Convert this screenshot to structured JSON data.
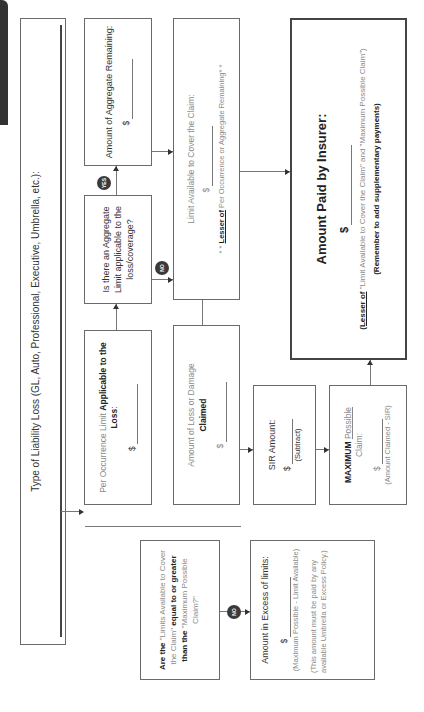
{
  "diagram": {
    "orientation": "rotated-90-ccw",
    "title_box": {
      "text": "Type of Liability Loss (GL, Auto, Professional, Executive, Umbrella, etc.):"
    },
    "per_occurrence": {
      "prefix": "Per Occurrence Limit ",
      "bold": "Applicable to the Loss",
      "suffix": ":",
      "dollar": "$"
    },
    "aggregate_question": {
      "text": "Is there an Aggregate Limit applicable to the loss/coverage?"
    },
    "aggregate_remaining": {
      "text": "Amount of Aggregate Remaining:",
      "dollar": "$"
    },
    "limit_available": {
      "text": "Limit Available to Cover the Claim:",
      "dollar": "$",
      "note_prefix": "* * ",
      "note_bold": "Lesser of",
      "note_rest": " Per Occurrence or Aggregate Remaining* *"
    },
    "amount_claimed": {
      "text": "Amount of Loss or Damage",
      "bold": "Claimed",
      "dollar": "$"
    },
    "sir_amount": {
      "text": "SIR Amount:",
      "dollar": "$",
      "note": "(Subtract)"
    },
    "maximum_possible": {
      "bold": "MAXIMUM",
      "underline": "Possible",
      "text2": "Claim:",
      "dollar": "$",
      "note": "(Amount Claimed - SIR)"
    },
    "amount_paid": {
      "title": "Amount Paid by Insurer:",
      "dollar": "$",
      "lesser_bold": "(Lesser of",
      "lesser_rest": " \"Limit Available to Cover the Claim\" and \"Maximum Possible Claim\")",
      "reminder": "(Remember to add supplementary payments)"
    },
    "limits_question": {
      "part1": "Are the ",
      "part2": "\"Limits Available to Cover the Claim\"",
      "part3": " equal to or greater than the ",
      "part4": "\"Maximum Possible Claim?\""
    },
    "excess": {
      "text": "Amount in Excess of limits:",
      "dollar": "$",
      "formula": "(Maximum Possible - Limit Available)",
      "note": "(This amount must be paid by any available Umbrella or Excess Policy.)"
    },
    "badges": {
      "yes": "YES",
      "no1": "NO",
      "no2": "NO"
    }
  },
  "colors": {
    "border": "#6a6a6a",
    "badge": "#3a3a3a",
    "tab": "#333333",
    "light_text": "#8a8a8a"
  }
}
